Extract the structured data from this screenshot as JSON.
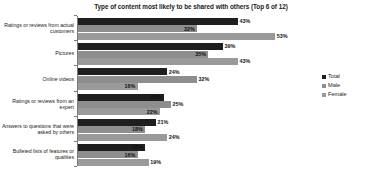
{
  "chart_data": {
    "type": "bar",
    "orientation": "horizontal",
    "title": "Type of content most likely to be shared with others (Top 6 of 12)",
    "xlabel": "",
    "ylabel": "",
    "xlim": [
      0,
      56
    ],
    "grid": false,
    "legend_position": "right",
    "categories": [
      "Ratings or reviews from actual customers",
      "Pictures",
      "Online videos",
      "Ratings or reviews from an expert",
      "Answers to questions that were asked by others",
      "Bulleted lists of features or qualities"
    ],
    "series": [
      {
        "name": "Total",
        "color": "#1f1f1f",
        "values": [
          43,
          39,
          24,
          23,
          21,
          18
        ],
        "labels": [
          "43%",
          "39%",
          "24%",
          "23%",
          "21%",
          "18%"
        ]
      },
      {
        "name": "Male",
        "color": "#8e8e8e",
        "values": [
          32,
          35,
          32,
          25,
          18,
          16
        ],
        "labels": [
          "32%",
          "35%",
          "32%",
          "25%",
          "18%",
          "16%"
        ]
      },
      {
        "name": "Female",
        "color": "#9a9a9a",
        "values": [
          53,
          43,
          16,
          22,
          24,
          19
        ],
        "labels": [
          "53%",
          "43%",
          "16%",
          "22%",
          "24%",
          "19%"
        ]
      }
    ]
  },
  "legend": {
    "items": [
      {
        "label": "Total",
        "color": "#1f1f1f"
      },
      {
        "label": "Male",
        "color": "#8e8e8e"
      },
      {
        "label": "Female",
        "color": "#9a9a9a"
      }
    ]
  }
}
